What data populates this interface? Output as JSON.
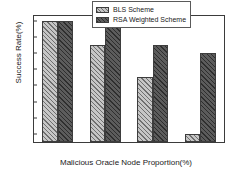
{
  "chart_data": {
    "type": "bar",
    "title": "",
    "xlabel": "Malicious Oracle Node Proportion(%)",
    "ylabel": "Success Rate(%)",
    "categories": [
      "10",
      "20",
      "30",
      "40"
    ],
    "series": [
      {
        "name": "BLS Scheme",
        "values": [
          100,
          97,
          93,
          86
        ],
        "color": "#c6c6c6",
        "hatch": "///"
      },
      {
        "name": "RSA Weighted Scheme",
        "values": [
          100,
          100,
          97,
          96
        ],
        "color": "#5c5c5c",
        "hatch": "///"
      }
    ],
    "ylim": [
      85,
      100.6
    ],
    "yticks": [
      86,
      88,
      90,
      92,
      94,
      96,
      98,
      100
    ],
    "ytick_labels": [
      "86",
      "88",
      "90",
      "92",
      "94",
      "96",
      "98",
      "100"
    ],
    "xtick_labels": [
      "10",
      "20",
      "30",
      "40"
    ],
    "grid": false,
    "legend_position": "top-right",
    "frame": true
  },
  "legend": {
    "items": [
      {
        "label": "BLS Scheme"
      },
      {
        "label": "RSA Weighted Scheme"
      }
    ]
  },
  "axes": {
    "y_title": "Success Rate(%)",
    "x_title": "Malicious Oracle Node Proportion(%)"
  }
}
